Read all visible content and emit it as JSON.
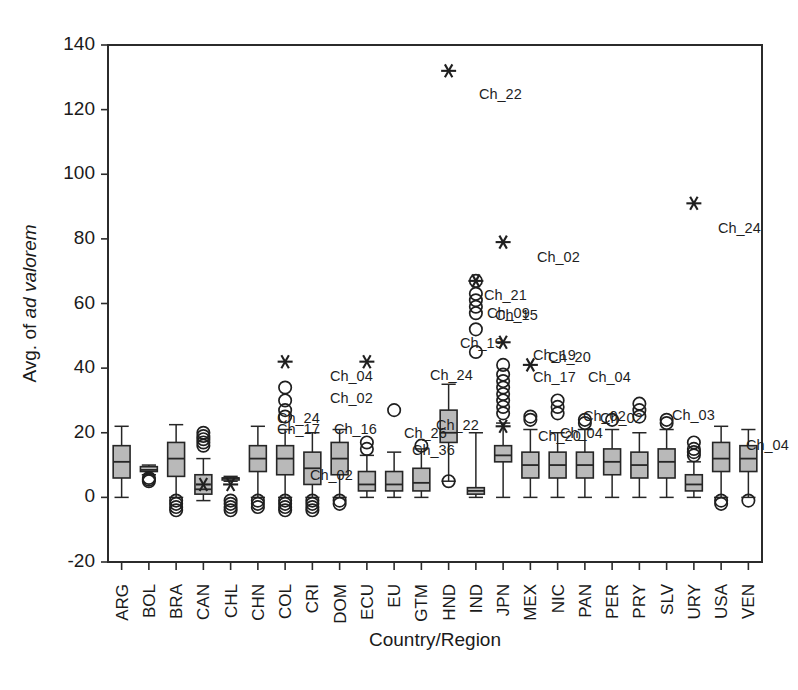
{
  "chart_data": {
    "type": "box",
    "title": "",
    "xlabel": "Country/Region",
    "ylabel_prefix": "Avg. of ",
    "ylabel_italic": "ad valorem",
    "ylim": [
      -20,
      140
    ],
    "yticks": [
      -20,
      0,
      20,
      40,
      60,
      80,
      100,
      120,
      140
    ],
    "grid": false,
    "legend": "none",
    "categories": [
      "ARG",
      "BOL",
      "BRA",
      "CAN",
      "CHL",
      "CHN",
      "COL",
      "CRI",
      "DOM",
      "ECU",
      "EU",
      "GTM",
      "HND",
      "IND",
      "JPN",
      "MEX",
      "NIC",
      "PAN",
      "PER",
      "PRY",
      "SLV",
      "URY",
      "USA",
      "VEN"
    ],
    "boxes": [
      {
        "cat": "ARG",
        "whisker_low": 0.0,
        "q1": 6.0,
        "median": 11.0,
        "q3": 16.0,
        "whisker_high": 22.0
      },
      {
        "cat": "BOL",
        "whisker_low": 7.0,
        "q1": 8.0,
        "median": 8.5,
        "q3": 9.5,
        "whisker_high": 10.0
      },
      {
        "cat": "BRA",
        "whisker_low": 0.0,
        "q1": 6.5,
        "median": 12.0,
        "q3": 17.0,
        "whisker_high": 22.5
      },
      {
        "cat": "CAN",
        "whisker_low": -1.0,
        "q1": 1.0,
        "median": 2.5,
        "q3": 7.0,
        "whisker_high": 12.0
      },
      {
        "cat": "CHL",
        "whisker_low": 5.0,
        "q1": 6.0,
        "median": 6.0,
        "q3": 6.0,
        "whisker_high": 6.5
      },
      {
        "cat": "CHN",
        "whisker_low": 0.0,
        "q1": 8.0,
        "median": 12.0,
        "q3": 16.0,
        "whisker_high": 22.0
      },
      {
        "cat": "COL",
        "whisker_low": 0.0,
        "q1": 7.0,
        "median": 12.0,
        "q3": 16.0,
        "whisker_high": 21.0
      },
      {
        "cat": "CRI",
        "whisker_low": 0.0,
        "q1": 4.0,
        "median": 9.0,
        "q3": 14.0,
        "whisker_high": 20.0
      },
      {
        "cat": "DOM",
        "whisker_low": 0.0,
        "q1": 7.0,
        "median": 12.0,
        "q3": 17.0,
        "whisker_high": 21.0
      },
      {
        "cat": "ECU",
        "whisker_low": 0.0,
        "q1": 2.0,
        "median": 4.0,
        "q3": 8.0,
        "whisker_high": 13.0
      },
      {
        "cat": "EU",
        "whisker_low": 0.0,
        "q1": 2.0,
        "median": 4.0,
        "q3": 8.0,
        "whisker_high": 14.0
      },
      {
        "cat": "GTM",
        "whisker_low": 0.0,
        "q1": 2.0,
        "median": 4.5,
        "q3": 9.0,
        "whisker_high": 15.0
      },
      {
        "cat": "HND",
        "whisker_low": 5.0,
        "q1": 17.0,
        "median": 20.0,
        "q3": 27.0,
        "whisker_high": 35.0
      },
      {
        "cat": "IND",
        "whisker_low": 0.0,
        "q1": 1.0,
        "median": 2.0,
        "q3": 3.0,
        "whisker_high": 20.0
      },
      {
        "cat": "JPN",
        "whisker_low": 0.0,
        "q1": 11.0,
        "median": 13.0,
        "q3": 16.0,
        "whisker_high": 23.0
      },
      {
        "cat": "MEX",
        "whisker_low": 0.0,
        "q1": 6.0,
        "median": 10.0,
        "q3": 14.0,
        "whisker_high": 21.0
      },
      {
        "cat": "NIC",
        "whisker_low": 0.0,
        "q1": 6.0,
        "median": 10.0,
        "q3": 14.0,
        "whisker_high": 20.0
      },
      {
        "cat": "PAN",
        "whisker_low": 0.0,
        "q1": 6.0,
        "median": 10.0,
        "q3": 14.0,
        "whisker_high": 21.0
      },
      {
        "cat": "PER",
        "whisker_low": 0.0,
        "q1": 7.0,
        "median": 11.0,
        "q3": 15.0,
        "whisker_high": 21.0
      },
      {
        "cat": "PRY",
        "whisker_low": 0.0,
        "q1": 6.0,
        "median": 10.0,
        "q3": 14.0,
        "whisker_high": 20.0
      },
      {
        "cat": "SLV",
        "whisker_low": 0.0,
        "q1": 6.0,
        "median": 11.0,
        "q3": 15.0,
        "whisker_high": 21.0
      },
      {
        "cat": "URY",
        "whisker_low": 0.0,
        "q1": 2.0,
        "median": 4.0,
        "q3": 7.0,
        "whisker_high": 11.0
      },
      {
        "cat": "USA",
        "whisker_low": 0.0,
        "q1": 8.0,
        "median": 12.0,
        "q3": 17.0,
        "whisker_high": 22.0
      },
      {
        "cat": "VEN",
        "whisker_low": 0.0,
        "q1": 8.0,
        "median": 12.0,
        "q3": 16.0,
        "whisker_high": 21.0
      }
    ],
    "outliers": [
      {
        "cat": "BOL",
        "value": 6.0
      },
      {
        "cat": "BOL",
        "value": 5.5
      },
      {
        "cat": "BOL",
        "value": 5.0
      },
      {
        "cat": "BRA",
        "value": -1.0
      },
      {
        "cat": "BRA",
        "value": -2.0
      },
      {
        "cat": "BRA",
        "value": -3.0
      },
      {
        "cat": "BRA",
        "value": -4.0
      },
      {
        "cat": "CAN",
        "value": 16.0
      },
      {
        "cat": "CAN",
        "value": 17.0
      },
      {
        "cat": "CAN",
        "value": 18.0
      },
      {
        "cat": "CAN",
        "value": 19.0
      },
      {
        "cat": "CAN",
        "value": 20.0
      },
      {
        "cat": "CHL",
        "value": -1.0
      },
      {
        "cat": "CHL",
        "value": -2.0
      },
      {
        "cat": "CHL",
        "value": -3.0
      },
      {
        "cat": "CHL",
        "value": -4.0
      },
      {
        "cat": "CHN",
        "value": -1.0
      },
      {
        "cat": "CHN",
        "value": -2.0
      },
      {
        "cat": "CHN",
        "value": -3.0
      },
      {
        "cat": "COL",
        "value": 34.0
      },
      {
        "cat": "COL",
        "value": 30.0
      },
      {
        "cat": "COL",
        "value": 27.0
      },
      {
        "cat": "COL",
        "value": 25.0
      },
      {
        "cat": "COL",
        "value": -1.0
      },
      {
        "cat": "COL",
        "value": -2.0
      },
      {
        "cat": "COL",
        "value": -3.0
      },
      {
        "cat": "COL",
        "value": -4.0
      },
      {
        "cat": "CRI",
        "value": -1.0
      },
      {
        "cat": "CRI",
        "value": -2.0
      },
      {
        "cat": "CRI",
        "value": -3.0
      },
      {
        "cat": "CRI",
        "value": -4.0
      },
      {
        "cat": "DOM",
        "value": -1.0
      },
      {
        "cat": "DOM",
        "value": -2.0
      },
      {
        "cat": "ECU",
        "value": 17.0
      },
      {
        "cat": "ECU",
        "value": 15.0
      },
      {
        "cat": "EU",
        "value": 27.0
      },
      {
        "cat": "GTM",
        "value": 16.0
      },
      {
        "cat": "HND",
        "value": 5.0
      },
      {
        "cat": "IND",
        "value": 67.0
      },
      {
        "cat": "IND",
        "value": 63.0
      },
      {
        "cat": "IND",
        "value": 61.0
      },
      {
        "cat": "IND",
        "value": 59.0
      },
      {
        "cat": "IND",
        "value": 57.0
      },
      {
        "cat": "IND",
        "value": 52.0
      },
      {
        "cat": "IND",
        "value": 45.0
      },
      {
        "cat": "JPN",
        "value": 41.0
      },
      {
        "cat": "JPN",
        "value": 38.0
      },
      {
        "cat": "JPN",
        "value": 36.0
      },
      {
        "cat": "JPN",
        "value": 34.0
      },
      {
        "cat": "JPN",
        "value": 32.0
      },
      {
        "cat": "JPN",
        "value": 30.0
      },
      {
        "cat": "JPN",
        "value": 28.0
      },
      {
        "cat": "JPN",
        "value": 26.0
      },
      {
        "cat": "MEX",
        "value": 25.0
      },
      {
        "cat": "MEX",
        "value": 24.0
      },
      {
        "cat": "NIC",
        "value": 30.0
      },
      {
        "cat": "NIC",
        "value": 28.0
      },
      {
        "cat": "NIC",
        "value": 26.0
      },
      {
        "cat": "PAN",
        "value": 24.0
      },
      {
        "cat": "PAN",
        "value": 23.0
      },
      {
        "cat": "PER",
        "value": 24.0
      },
      {
        "cat": "PRY",
        "value": 29.0
      },
      {
        "cat": "PRY",
        "value": 27.0
      },
      {
        "cat": "PRY",
        "value": 25.0
      },
      {
        "cat": "SLV",
        "value": 24.0
      },
      {
        "cat": "SLV",
        "value": 23.0
      },
      {
        "cat": "URY",
        "value": 17.0
      },
      {
        "cat": "URY",
        "value": 15.0
      },
      {
        "cat": "URY",
        "value": 14.0
      },
      {
        "cat": "URY",
        "value": 13.0
      },
      {
        "cat": "USA",
        "value": -1.0
      },
      {
        "cat": "USA",
        "value": -2.0
      },
      {
        "cat": "VEN",
        "value": -1.0
      }
    ],
    "extremes": [
      {
        "cat": "HND",
        "value": 132.0,
        "label": "Ch_22"
      },
      {
        "cat": "URY",
        "value": 91.0,
        "label": "Ch_24"
      },
      {
        "cat": "JPN",
        "value": 79.0,
        "label": "Ch_02"
      },
      {
        "cat": "IND",
        "value": 67.0,
        "label": "Ch_21"
      },
      {
        "cat": "JPN",
        "value": 48.0,
        "label": "Ch_19"
      },
      {
        "cat": "MEX",
        "value": 41.0,
        "label": "Ch_04"
      },
      {
        "cat": "COL",
        "value": 42.0,
        "label": "Ch_04"
      },
      {
        "cat": "ECU",
        "value": 42.0,
        "label": "Ch_24"
      },
      {
        "cat": "CHL",
        "value": 4.0,
        "label": "Ch_02"
      },
      {
        "cat": "CAN",
        "value": 4.0,
        "label": ""
      },
      {
        "cat": "JPN",
        "value": 22.0,
        "label": ""
      }
    ],
    "annotations": [
      {
        "label": "Ch_22",
        "x": 479,
        "y": 99
      },
      {
        "label": "Ch_24",
        "x": 718,
        "y": 233
      },
      {
        "label": "Ch_02",
        "x": 537,
        "y": 262
      },
      {
        "label": "Ch_21",
        "x": 484,
        "y": 300
      },
      {
        "label": "Ch_09",
        "x": 487,
        "y": 318
      },
      {
        "label": "Ch_15",
        "x": 495,
        "y": 320
      },
      {
        "label": "Ch_19",
        "x": 460,
        "y": 348
      },
      {
        "label": "Ch_19",
        "x": 533,
        "y": 360
      },
      {
        "label": "Ch_20",
        "x": 548,
        "y": 362
      },
      {
        "label": "Ch_17",
        "x": 533,
        "y": 382
      },
      {
        "label": "Ch_04",
        "x": 588,
        "y": 382
      },
      {
        "label": "Ch_04",
        "x": 330,
        "y": 381
      },
      {
        "label": "Ch_02",
        "x": 330,
        "y": 403
      },
      {
        "label": "Ch_24",
        "x": 430,
        "y": 380
      },
      {
        "label": "Ch_24",
        "x": 277,
        "y": 423
      },
      {
        "label": "Ch_17",
        "x": 277,
        "y": 434
      },
      {
        "label": "Ch_16",
        "x": 334,
        "y": 434
      },
      {
        "label": "Ch_22",
        "x": 436,
        "y": 430
      },
      {
        "label": "Ch_36",
        "x": 412,
        "y": 455
      },
      {
        "label": "Ch_02",
        "x": 583,
        "y": 421
      },
      {
        "label": "Ch_02",
        "x": 600,
        "y": 423
      },
      {
        "label": "Ch_03",
        "x": 672,
        "y": 420
      },
      {
        "label": "Ch_04",
        "x": 560,
        "y": 438
      },
      {
        "label": "Ch_20",
        "x": 538,
        "y": 441
      },
      {
        "label": "Ch_04",
        "x": 746,
        "y": 450
      },
      {
        "label": "Ch_02",
        "x": 310,
        "y": 480
      },
      {
        "label": "Ch_26",
        "x": 404,
        "y": 438
      }
    ]
  }
}
